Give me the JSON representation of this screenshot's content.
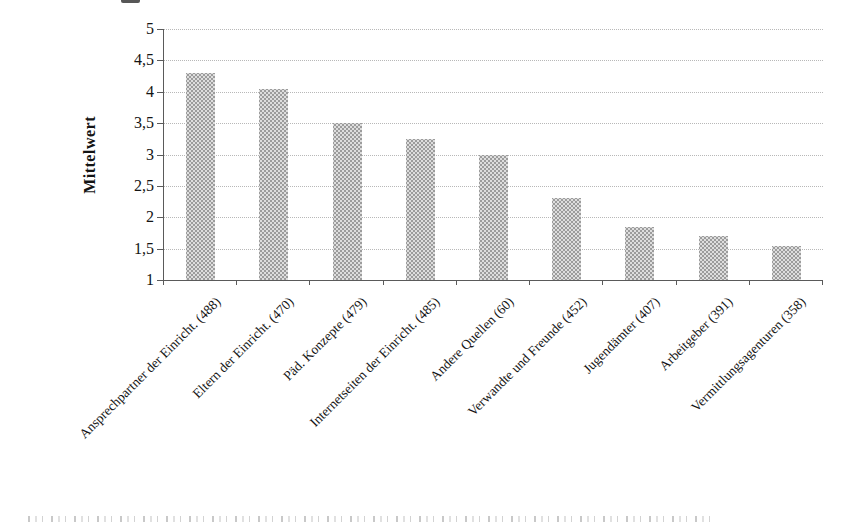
{
  "chart_data": {
    "type": "bar",
    "title": "",
    "xlabel": "",
    "ylabel": "Mittelwert",
    "categories": [
      "Ansprechpartner der Einricht. (488)",
      "Eltern der Einricht. (470)",
      "Päd. Konzepte (479)",
      "Internetseiten der Einricht. (485)",
      "Andere Quellen (60)",
      "Verwandte und Freunde (452)",
      "Jugendämter (407)",
      "Arbeitgeber (391)",
      "Vermittlungsagenturen (358)"
    ],
    "values": [
      4.3,
      4.05,
      3.5,
      3.25,
      3.0,
      2.3,
      1.85,
      1.7,
      1.55
    ],
    "ylim": [
      1,
      5
    ],
    "ytick_step": 0.5,
    "ytick_labels": [
      "5",
      "4,5",
      "4",
      "3,5",
      "3",
      "2,5",
      "2",
      "1,5",
      "1"
    ],
    "grid": "horizontal-dotted",
    "legend_position": "none",
    "category_label_rotation_deg": 45,
    "colors": {
      "bar_fill": "#dedede",
      "bar_dot_pattern": "#9c9c9c",
      "axis": "#5a5a5a",
      "gridline": "#b8b8b8",
      "text": "#141414",
      "background": "#ffffff"
    }
  }
}
